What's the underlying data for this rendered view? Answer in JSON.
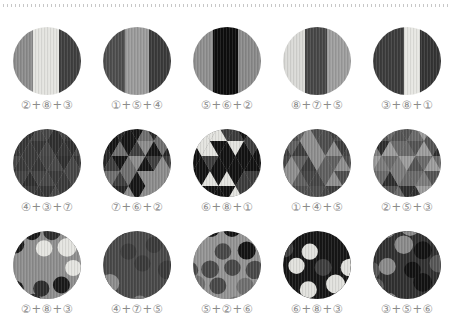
{
  "page": {
    "background": "#ffffff",
    "divider": {
      "style": "dotted",
      "color": "#c8c8c8"
    },
    "label_color": "#8b8b8b"
  },
  "grid": {
    "rows": [
      {
        "pattern": "stripes",
        "items": [
          {
            "label": "②+⑧+③",
            "stripes": {
              "colors": [
                "#8c8c8c",
                "#e3e3df",
                "#3f3f3f"
              ],
              "widths": [
                30,
                37,
                33
              ]
            }
          },
          {
            "label": "①+⑤+④",
            "stripes": {
              "colors": [
                "#4e4e4e",
                "#9b9b9b",
                "#3a3a3a"
              ],
              "widths": [
                32,
                36,
                32
              ]
            }
          },
          {
            "label": "⑤+⑥+②",
            "stripes": {
              "colors": [
                "#8f8f8f",
                "#0d0d0d",
                "#8a8a8a"
              ],
              "widths": [
                30,
                36,
                34
              ]
            }
          },
          {
            "label": "⑧+⑦+⑤",
            "stripes": {
              "colors": [
                "#d9d9d6",
                "#474747",
                "#9e9e9e"
              ],
              "widths": [
                33,
                32,
                35
              ]
            }
          },
          {
            "label": "③+⑧+①",
            "stripes": {
              "colors": [
                "#3c3c3c",
                "#e6e6e2",
                "#343434"
              ],
              "widths": [
                45,
                24,
                31
              ]
            }
          }
        ]
      },
      {
        "pattern": "triangles",
        "items": [
          {
            "label": "④+③+⑦",
            "triangles": {
              "colors": [
                "#474747",
                "#3a3a3a",
                "#515151",
                "#363636",
                "#444444",
                "#2f2f2f"
              ]
            }
          },
          {
            "label": "⑦+⑥+②",
            "triangles": {
              "colors": [
                "#161616",
                "#161616",
                "#6f6f6f",
                "#3e3e3e",
                "#8c8c8c",
                "#262626"
              ]
            }
          },
          {
            "label": "⑥+⑧+①",
            "triangles": {
              "colors": [
                "#121212",
                "#121212",
                "#e3e3df",
                "#e3e3df",
                "#3c3c3c"
              ]
            }
          },
          {
            "label": "①+④+⑤",
            "triangles": {
              "colors": [
                "#4e4e4e",
                "#8e8e8e",
                "#3d3d3d",
                "#606060",
                "#454545"
              ]
            }
          },
          {
            "label": "②+⑤+③",
            "triangles": {
              "colors": [
                "#7c7c7c",
                "#2e2e2e",
                "#9c9c9c",
                "#545454",
                "#6a6a6a"
              ]
            }
          }
        ]
      },
      {
        "pattern": "dots",
        "items": [
          {
            "label": "②+⑧+③",
            "dots": {
              "background": "#8e8e8e",
              "colors": [
                "#e4e4e0",
                "#1a1a1a",
                "#e4e4e0",
                "#2e2e2e"
              ]
            }
          },
          {
            "label": "④+⑦+⑤",
            "dots": {
              "background": "#494949",
              "colors": [
                "#8c8c8c",
                "#6d6d6d",
                "#3a3a3a",
                "#7d7d7d"
              ]
            }
          },
          {
            "label": "⑤+②+⑥",
            "dots": {
              "background": "#939393",
              "colors": [
                "#141414",
                "#707070",
                "#484848",
                "#141414"
              ]
            }
          },
          {
            "label": "⑥+⑧+③",
            "dots": {
              "background": "#161616",
              "colors": [
                "#e1e1dd",
                "#3d3d3d",
                "#2b2b2b",
                "#e1e1dd"
              ]
            }
          },
          {
            "label": "③+⑤+⑥",
            "dots": {
              "background": "#303030",
              "colors": [
                "#8a8a8a",
                "#121212",
                "#575757",
                "#8a8a8a"
              ]
            }
          }
        ]
      }
    ]
  }
}
